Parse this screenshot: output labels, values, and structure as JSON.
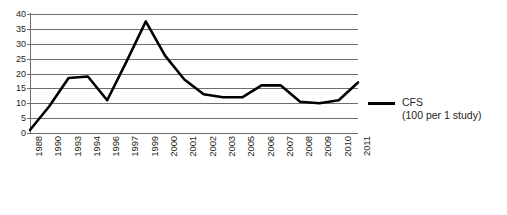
{
  "chart_data": {
    "type": "line",
    "title": "",
    "xlabel": "",
    "ylabel": "",
    "ylim": [
      0,
      40
    ],
    "yticks": [
      40,
      35,
      30,
      25,
      20,
      15,
      10,
      5,
      0
    ],
    "grid": "horizontal",
    "legend_position": "right",
    "categories": [
      "1988",
      "1990",
      "1993",
      "1994",
      "1996",
      "1997",
      "1999",
      "2000",
      "2001",
      "2002",
      "2003",
      "2005",
      "2006",
      "2007",
      "2008",
      "2009",
      "2010",
      "2011"
    ],
    "series": [
      {
        "name": "CFS",
        "sublabel": "(100 per 1 study)",
        "color": "#000000",
        "values": [
          1,
          9,
          18.5,
          19,
          11,
          24,
          37.5,
          26,
          18,
          13,
          12,
          12,
          16,
          16,
          10.5,
          10,
          11,
          17
        ]
      }
    ]
  },
  "legend": {
    "label": "CFS",
    "sublabel": "(100 per 1 study)",
    "swatch_color": "#000000"
  },
  "axes": {
    "y_tick_labels": [
      "40",
      "35",
      "30",
      "25",
      "20",
      "15",
      "10",
      "5",
      "0"
    ],
    "x_tick_labels": [
      "1988",
      "1990",
      "1993",
      "1994",
      "1996",
      "1997",
      "1999",
      "2000",
      "2001",
      "2002",
      "2003",
      "2005",
      "2006",
      "2007",
      "2008",
      "2009",
      "2010",
      "2011"
    ]
  }
}
